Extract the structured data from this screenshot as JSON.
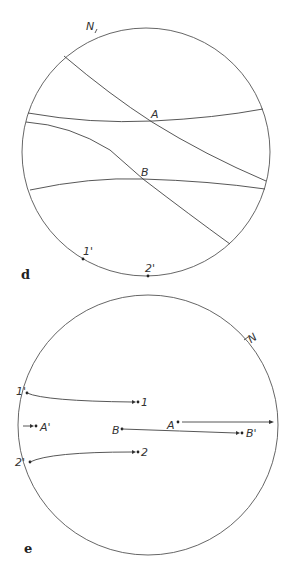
{
  "panel_d": {
    "label": "d",
    "north_label": "N",
    "points": {
      "A": "A",
      "B": "B",
      "one_prime": "1'",
      "two_prime": "2'"
    }
  },
  "panel_e": {
    "label": "e",
    "north_label": "N",
    "points": {
      "one_prime": "1'",
      "one": "1",
      "a_prime": "A'",
      "a": "A",
      "b": "B",
      "b_prime": "B'",
      "two_prime": "2'",
      "two": "2"
    }
  },
  "colors": {
    "line": "#444444",
    "text": "#333333",
    "background": "#ffffff"
  }
}
